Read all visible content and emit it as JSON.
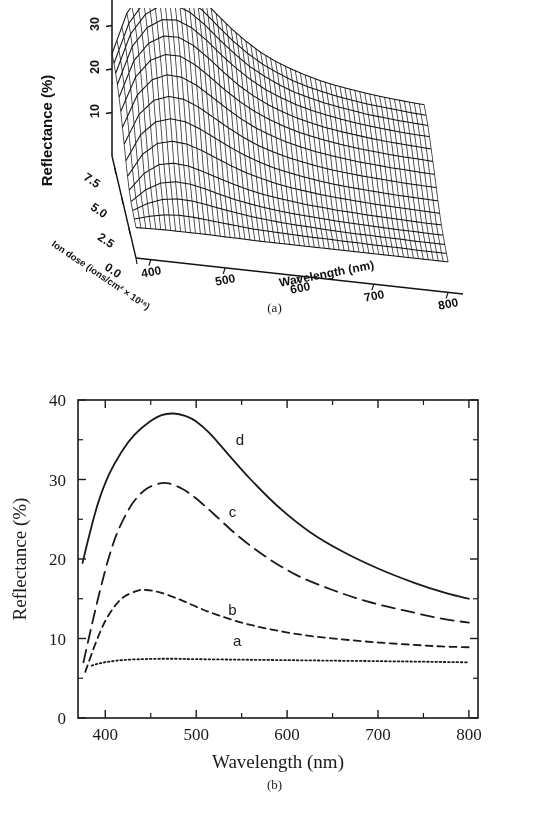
{
  "figure": {
    "panel_a_caption": "(a)",
    "panel_b_caption": "(b)"
  },
  "panel_a": {
    "type": "surface3d",
    "ylabel": "Reflectance (%)",
    "xlabel": "Wavelength (nm)",
    "zlabel": "Ion dose (ions/cm² × 10¹⁶)",
    "refl_ticks": [
      "10",
      "20",
      "30",
      "40"
    ],
    "refl_tick_values": [
      10,
      20,
      30,
      40
    ],
    "wave_ticks": [
      "400",
      "500",
      "600",
      "700",
      "800"
    ],
    "wave_tick_values": [
      400,
      500,
      600,
      700,
      800
    ],
    "dose_ticks": [
      "7.5",
      "5.0",
      "2.5",
      "0.0"
    ],
    "dose_tick_values": [
      7.5,
      5.0,
      2.5,
      0.0
    ],
    "zlim": [
      0,
      45
    ],
    "xlim": [
      380,
      820
    ],
    "doselim": [
      0,
      8.5
    ]
  },
  "chart_data": [
    {
      "type": "surface",
      "title": "",
      "xlabel": "Wavelength (nm)",
      "ylabel": "Ion dose (ions/cm2 x 10^16)",
      "zlabel": "Reflectance (%)",
      "xlim": [
        380,
        820
      ],
      "ylim": [
        0,
        8.5
      ],
      "zlim": [
        0,
        45
      ],
      "x": [
        380,
        400,
        420,
        440,
        460,
        480,
        500,
        520,
        540,
        560,
        580,
        600,
        620,
        640,
        660,
        680,
        700,
        720,
        740,
        760,
        780,
        800
      ],
      "y": [
        0.0,
        0.6,
        1.2,
        1.8,
        2.4,
        3.0,
        3.6,
        4.2,
        4.8,
        5.4,
        6.0,
        6.6,
        7.2,
        7.8,
        8.5
      ],
      "z_description": "Reflectance surface rising from ~7% flat at zero ion dose to a peak near 42% at ~480 nm for the highest ion dose, with a long-wavelength shoulder near 15%.",
      "z_rows": [
        [
          7.0,
          7.1,
          7.2,
          7.2,
          7.2,
          7.2,
          7.1,
          7.1,
          7.0,
          7.0,
          7.0,
          7.0,
          7.0,
          7.0,
          7.0,
          7.0,
          7.0,
          7.0,
          7.0,
          7.0,
          7.0,
          7.0
        ],
        [
          7.3,
          8.3,
          9.0,
          9.3,
          9.2,
          8.9,
          8.6,
          8.3,
          8.0,
          7.9,
          7.8,
          7.7,
          7.6,
          7.6,
          7.5,
          7.5,
          7.4,
          7.4,
          7.4,
          7.3,
          7.3,
          7.3
        ],
        [
          7.6,
          9.6,
          10.9,
          11.4,
          11.3,
          10.8,
          10.2,
          9.7,
          9.2,
          8.9,
          8.6,
          8.4,
          8.3,
          8.1,
          8.0,
          7.9,
          7.9,
          7.8,
          7.8,
          7.7,
          7.7,
          7.7
        ],
        [
          8.0,
          11.1,
          13.0,
          13.7,
          13.5,
          12.8,
          11.9,
          11.1,
          10.5,
          10.0,
          9.6,
          9.3,
          9.1,
          8.9,
          8.7,
          8.6,
          8.5,
          8.4,
          8.3,
          8.3,
          8.2,
          8.2
        ],
        [
          9.0,
          13.2,
          15.6,
          16.3,
          16.0,
          15.1,
          14.0,
          13.0,
          12.1,
          11.4,
          10.9,
          10.5,
          10.1,
          9.9,
          9.6,
          9.5,
          9.3,
          9.2,
          9.1,
          9.0,
          8.9,
          8.9
        ],
        [
          10.5,
          15.9,
          18.8,
          19.7,
          19.4,
          18.3,
          16.9,
          15.5,
          14.3,
          13.4,
          12.6,
          12.0,
          11.6,
          11.2,
          10.9,
          10.7,
          10.5,
          10.3,
          10.2,
          10.1,
          10.0,
          9.9
        ],
        [
          12.4,
          18.8,
          22.1,
          23.2,
          22.9,
          21.6,
          19.9,
          18.2,
          16.7,
          15.5,
          14.5,
          13.8,
          13.2,
          12.7,
          12.3,
          12.0,
          11.8,
          11.6,
          11.4,
          11.3,
          11.2,
          11.1
        ],
        [
          14.6,
          21.8,
          25.4,
          26.7,
          26.4,
          25.0,
          23.0,
          21.0,
          19.2,
          17.7,
          16.6,
          15.7,
          15.0,
          14.4,
          13.9,
          13.6,
          13.3,
          13.1,
          12.9,
          12.7,
          12.6,
          12.5
        ],
        [
          16.8,
          24.6,
          28.5,
          30.0,
          29.8,
          28.3,
          26.1,
          23.8,
          21.7,
          20.0,
          18.7,
          17.6,
          16.8,
          16.1,
          15.6,
          15.2,
          14.8,
          14.6,
          14.3,
          14.2,
          14.0,
          13.9
        ],
        [
          18.8,
          27.1,
          31.3,
          33.0,
          33.0,
          31.4,
          29.0,
          26.4,
          24.1,
          22.2,
          20.7,
          19.5,
          18.5,
          17.8,
          17.2,
          16.7,
          16.3,
          16.0,
          15.7,
          15.5,
          15.4,
          15.2
        ],
        [
          20.4,
          29.2,
          33.6,
          35.6,
          35.7,
          34.2,
          31.7,
          28.9,
          26.3,
          24.2,
          22.5,
          21.2,
          20.1,
          19.3,
          18.6,
          18.1,
          17.7,
          17.3,
          17.0,
          16.8,
          16.6,
          16.4
        ],
        [
          21.7,
          30.8,
          35.5,
          37.7,
          38.0,
          36.6,
          34.1,
          31.1,
          28.4,
          26.1,
          24.2,
          22.8,
          21.6,
          20.7,
          20.0,
          19.4,
          18.9,
          18.5,
          18.2,
          17.9,
          17.7,
          17.6
        ],
        [
          22.6,
          32.0,
          36.9,
          39.3,
          39.8,
          38.5,
          36.0,
          32.9,
          30.1,
          27.6,
          25.7,
          24.1,
          22.8,
          21.9,
          21.1,
          20.5,
          20.0,
          19.5,
          19.2,
          18.9,
          18.7,
          18.5
        ],
        [
          23.2,
          32.8,
          37.9,
          40.4,
          41.1,
          39.9,
          37.5,
          34.4,
          31.4,
          28.9,
          26.8,
          25.2,
          23.8,
          22.8,
          22.0,
          21.3,
          20.8,
          20.3,
          20.0,
          19.7,
          19.4,
          19.2
        ],
        [
          23.5,
          33.2,
          38.5,
          41.2,
          42.0,
          40.9,
          38.5,
          35.4,
          32.4,
          29.8,
          27.6,
          25.9,
          24.6,
          23.5,
          22.6,
          21.9,
          21.4,
          20.9,
          20.5,
          20.2,
          19.9,
          19.7
        ]
      ]
    },
    {
      "type": "line",
      "title": "",
      "xlabel": "Wavelength (nm)",
      "ylabel": "Reflectance (%)",
      "xlim": [
        370,
        810
      ],
      "ylim": [
        0,
        40
      ],
      "xticks": [
        400,
        500,
        600,
        700,
        800
      ],
      "xminor_step": 50,
      "yticks": [
        0,
        10,
        20,
        30,
        40
      ],
      "yminor_step": 5,
      "grid": false,
      "legend": "inline-labels",
      "series": [
        {
          "name": "a",
          "label": "a",
          "style": "dotted",
          "label_x": 545,
          "label_y": 9.1,
          "x": [
            385,
            395,
            405,
            420,
            440,
            460,
            480,
            500,
            540,
            580,
            620,
            660,
            700,
            740,
            770,
            800
          ],
          "y": [
            6.6,
            6.9,
            7.1,
            7.3,
            7.4,
            7.45,
            7.45,
            7.4,
            7.35,
            7.3,
            7.25,
            7.2,
            7.15,
            7.1,
            7.05,
            7.0
          ]
        },
        {
          "name": "b",
          "label": "b",
          "style": "dashed-short",
          "label_x": 540,
          "label_y": 13.0,
          "x": [
            378,
            390,
            400,
            410,
            420,
            435,
            445,
            460,
            480,
            500,
            520,
            550,
            580,
            620,
            660,
            700,
            740,
            770,
            800
          ],
          "y": [
            5.8,
            9.6,
            12.2,
            14.0,
            15.2,
            16.0,
            16.1,
            15.8,
            15.0,
            14.0,
            13.1,
            12.0,
            11.2,
            10.4,
            9.9,
            9.5,
            9.2,
            9.0,
            8.9
          ]
        },
        {
          "name": "c",
          "label": "c",
          "style": "dashed-long",
          "label_x": 540,
          "label_y": 25.3,
          "x": [
            376,
            385,
            395,
            405,
            415,
            430,
            445,
            460,
            470,
            485,
            500,
            520,
            545,
            575,
            610,
            650,
            690,
            730,
            770,
            800
          ],
          "y": [
            7.0,
            11.6,
            16.4,
            20.6,
            23.8,
            27.0,
            28.8,
            29.5,
            29.5,
            28.8,
            27.6,
            25.6,
            23.0,
            20.4,
            18.0,
            16.1,
            14.6,
            13.5,
            12.5,
            12.0
          ]
        },
        {
          "name": "d",
          "label": "d",
          "style": "solid",
          "label_x": 548,
          "label_y": 34.4,
          "x": [
            375,
            382,
            392,
            404,
            418,
            432,
            448,
            462,
            475,
            488,
            500,
            515,
            535,
            560,
            590,
            625,
            660,
            700,
            740,
            775,
            800
          ],
          "y": [
            19.5,
            22.8,
            27.0,
            30.6,
            33.5,
            35.6,
            37.2,
            38.1,
            38.3,
            38.0,
            37.3,
            35.8,
            33.2,
            30.0,
            26.6,
            23.4,
            21.0,
            18.8,
            17.0,
            15.7,
            15.0
          ]
        }
      ]
    }
  ]
}
